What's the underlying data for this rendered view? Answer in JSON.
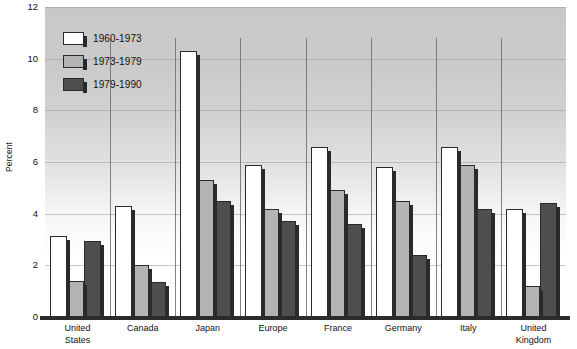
{
  "chart_data": {
    "type": "bar",
    "title": "",
    "xlabel": "",
    "ylabel": "Percent",
    "ylim": [
      0,
      12
    ],
    "yticks": [
      0,
      2,
      4,
      6,
      8,
      10,
      12
    ],
    "grid": true,
    "legend_position": "top-left",
    "categories": [
      "United\nStates",
      "Canada",
      "Japan",
      "Europe",
      "France",
      "Germany",
      "Italy",
      "United\nKingdom"
    ],
    "series": [
      {
        "name": "1960-1973",
        "color": "#ffffff",
        "values": [
          3.15,
          4.3,
          10.3,
          5.9,
          6.6,
          5.8,
          6.6,
          4.2
        ]
      },
      {
        "name": "1973-1979",
        "color": "#b4b4b4",
        "values": [
          1.4,
          2.0,
          5.3,
          4.2,
          4.9,
          4.5,
          5.9,
          1.2
        ]
      },
      {
        "name": "1979-1990",
        "color": "#4e4e4e",
        "values": [
          2.95,
          1.35,
          4.5,
          3.7,
          3.6,
          2.4,
          4.2,
          4.4
        ]
      }
    ]
  }
}
